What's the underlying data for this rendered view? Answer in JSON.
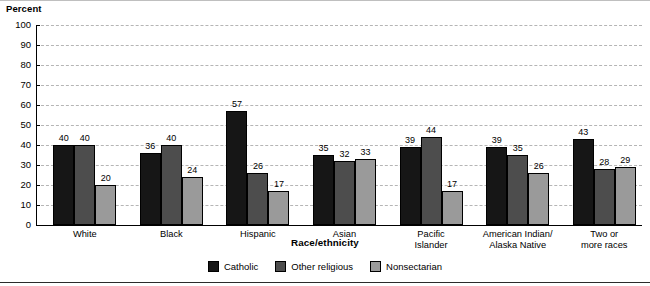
{
  "chart_data": {
    "type": "bar",
    "title": "",
    "xlabel": "Race/ethnicity",
    "ylabel": "Percent",
    "ylim": [
      0,
      100
    ],
    "yticks": [
      0,
      10,
      20,
      30,
      40,
      50,
      60,
      70,
      80,
      90,
      100
    ],
    "grid": true,
    "legend_position": "bottom",
    "categories": [
      "White",
      "Black",
      "Hispanic",
      "Asian",
      "Pacific Islander",
      "American Indian/ Alaska Native",
      "Two or more races"
    ],
    "category_lines": [
      [
        "White"
      ],
      [
        "Black"
      ],
      [
        "Hispanic"
      ],
      [
        "Asian"
      ],
      [
        "Pacific",
        "Islander"
      ],
      [
        "American Indian/",
        "Alaska Native"
      ],
      [
        "Two or",
        "more races"
      ]
    ],
    "series": [
      {
        "name": "Catholic",
        "color": "#161616",
        "values": [
          40,
          36,
          57,
          35,
          39,
          39,
          43
        ]
      },
      {
        "name": "Other religious",
        "color": "#4d4d4d",
        "values": [
          40,
          40,
          26,
          32,
          44,
          35,
          28
        ]
      },
      {
        "name": "Nonsectarian",
        "color": "#9a9a9a",
        "values": [
          20,
          24,
          17,
          33,
          17,
          26,
          29
        ]
      }
    ]
  }
}
